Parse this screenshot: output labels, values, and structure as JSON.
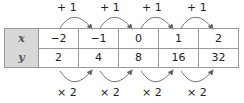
{
  "table": {
    "rows": [
      {
        "label": "x",
        "values": [
          "−2",
          "−1",
          "0",
          "1",
          "2"
        ]
      },
      {
        "label": "y",
        "values": [
          "2",
          "4",
          "8",
          "16",
          "32"
        ]
      }
    ]
  },
  "top_ops": [
    "+ 1",
    "+ 1",
    "+ 1",
    "+ 1"
  ],
  "bottom_ops": [
    "× 2",
    "× 2",
    "× 2",
    "× 2"
  ],
  "colors": {
    "header_bg": "#d8d8d8",
    "border": "#9a9a9a",
    "arrow": "#666666"
  }
}
